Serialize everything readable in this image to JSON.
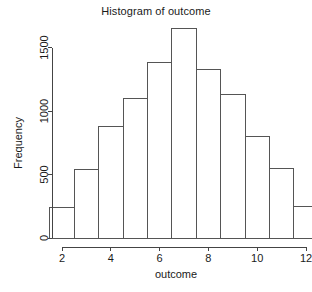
{
  "chart_data": {
    "type": "bar",
    "title": "Histogram of outcome",
    "xlabel": "outcome",
    "ylabel": "Frequency",
    "grid": false,
    "legend": false,
    "xlim": [
      1.5,
      12.5
    ],
    "ylim": [
      0,
      1650
    ],
    "xticks": [
      2,
      4,
      6,
      8,
      10,
      12
    ],
    "yticks": [
      0,
      500,
      1000,
      1500
    ],
    "xtick_labels": [
      "2",
      "4",
      "6",
      "8",
      "10",
      "12"
    ],
    "ytick_labels": [
      "0",
      "500",
      "1000",
      "1500"
    ],
    "bin_edges": [
      1.5,
      2.5,
      3.5,
      4.5,
      5.5,
      6.5,
      7.5,
      8.5,
      9.5,
      10.5,
      11.5,
      12.5
    ],
    "categories": [
      "2",
      "3",
      "4",
      "5",
      "6",
      "7",
      "8",
      "9",
      "10",
      "11",
      "12"
    ],
    "values": [
      240,
      540,
      880,
      1100,
      1380,
      1650,
      1330,
      1130,
      800,
      550,
      250
    ],
    "bar_color": "#ffffff",
    "bar_edge_color": "#555555",
    "axis_color": "#444444",
    "text_color": "#1a1a1a",
    "background": "#ffffff"
  }
}
